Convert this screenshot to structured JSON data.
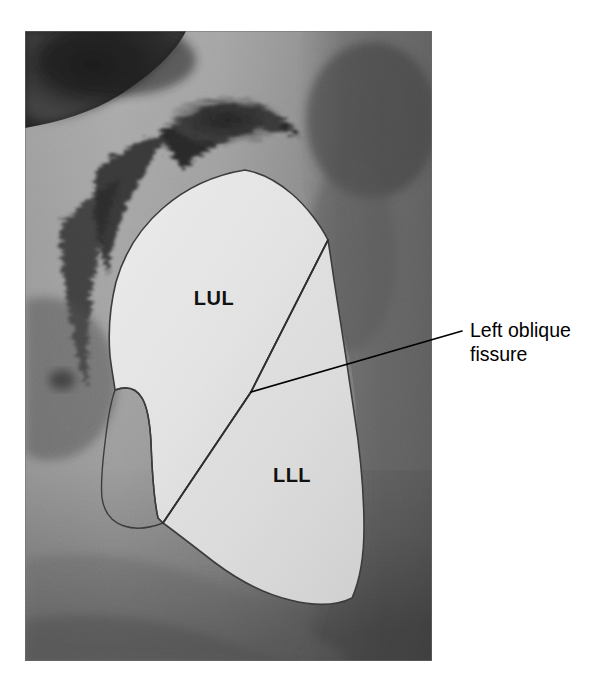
{
  "figure": {
    "type": "anatomical-photograph-with-overlay",
    "view": "left lateral view",
    "background_color": "#ffffff",
    "photo": {
      "x": 25,
      "y": 31,
      "width": 407,
      "height": 630,
      "mid_tone": "#8e8e8e",
      "shadow_tone": "#4a4a4a",
      "dark_tone": "#2a2a2a",
      "highlight_tone": "#b9b9b9"
    }
  },
  "overlay": {
    "outline_color": "#3a3a3a",
    "lung_fill_upper": "#e4e4e4",
    "lung_fill_lower": "#dcdcdc",
    "fissure_color": "#2e2e2e",
    "leader_color": "#000000"
  },
  "labels": {
    "upper_lobe": {
      "text": "LUL",
      "meaning": "left upper lobe",
      "x": 214,
      "y": 305
    },
    "lower_lobe": {
      "text": "LLL",
      "meaning": "left lower lobe",
      "x": 292,
      "y": 482
    }
  },
  "callout": {
    "line1": "Left oblique",
    "line2": "fissure",
    "text_x": 470,
    "line1_y": 337,
    "line2_y": 361,
    "leader": {
      "from_x": 251,
      "from_y": 392,
      "to_x": 462,
      "to_y": 331
    }
  }
}
